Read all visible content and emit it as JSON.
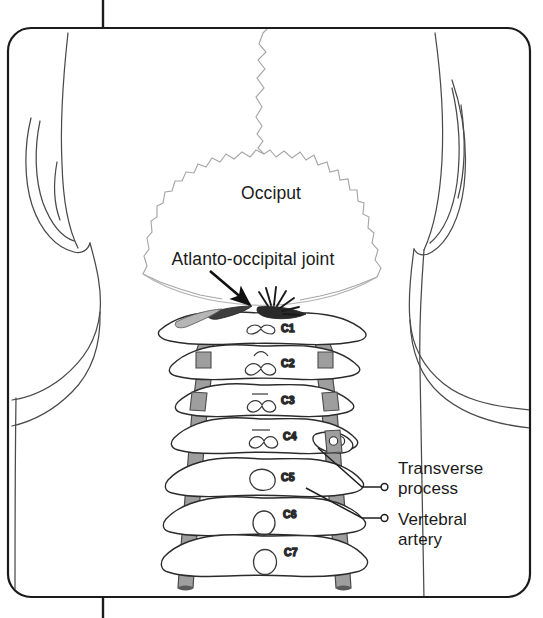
{
  "figure": {
    "frame": {
      "border_color": "#1b1b1b",
      "background": "#ffffff",
      "corner_radius": 22,
      "top_tick": true,
      "bottom_tick": true
    },
    "colors": {
      "outline": "#3a3a3a",
      "faint_outline": "#9a9a9a",
      "bone_outline": "#2b2b2b",
      "bone_fill": "#ffffff",
      "artery_fill": "#9a9a9a",
      "artery_stroke": "#4a4a4a",
      "joint_dark": "#2a2a2a",
      "text": "#1a1a1a",
      "leader_line": "#2a2a2a"
    },
    "labels": {
      "occiput": "Occiput",
      "atlanto_occipital_joint": "Atlanto-occipital joint",
      "transverse_process_line1": "Transverse",
      "transverse_process_line2": "process",
      "vertebral_artery_line1": "Vertebral",
      "vertebral_artery_line2": "artery"
    },
    "vertebrae": [
      {
        "id": "C1",
        "label": "C1",
        "label_x": 272,
        "label_y": 329
      },
      {
        "id": "C2",
        "label": "C2",
        "label_y": 363,
        "label_x": 272
      },
      {
        "id": "C3",
        "label": "C3",
        "label_x": 272,
        "label_y": 401
      },
      {
        "id": "C4",
        "label": "C4",
        "label_x": 274,
        "label_y": 436
      },
      {
        "id": "C5",
        "label": "C5",
        "label_x": 272,
        "label_y": 478
      },
      {
        "id": "C6",
        "label": "C6",
        "label_x": 274,
        "label_y": 516
      },
      {
        "id": "C7",
        "label": "C7",
        "label_x": 274,
        "label_y": 554
      }
    ],
    "annotations": {
      "arrow": {
        "name": "atlanto-occipital-joint-arrow",
        "from_x": 212,
        "from_y": 272,
        "to_x": 253,
        "to_y": 307
      },
      "starburst": {
        "name": "joint-pain-starburst",
        "center_x": 271,
        "center_y": 308,
        "ray_count": 7
      },
      "leaders": [
        {
          "name": "transverse-process-leader",
          "target_x": 318,
          "target_y": 452,
          "dot_x": 385,
          "dot_y": 492
        },
        {
          "name": "vertebral-artery-leader",
          "target_x": 305,
          "target_y": 490,
          "dot_x": 385,
          "dot_y": 518
        }
      ]
    }
  }
}
